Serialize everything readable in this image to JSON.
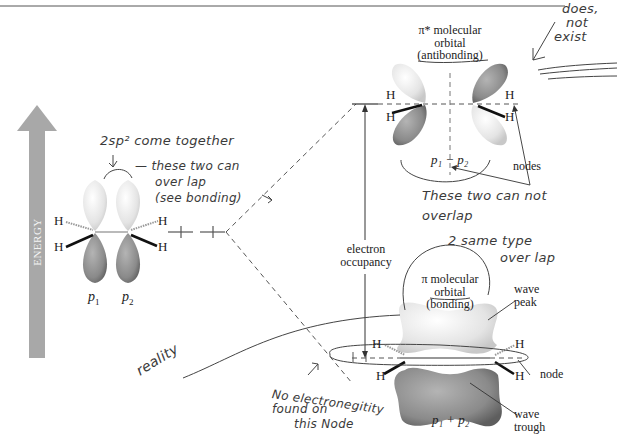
{
  "axis": {
    "energy_label": "ENERGY"
  },
  "atomic_orbitals": {
    "p1_label": "p",
    "p1_sub": "1",
    "p2_label": "p",
    "p2_sub": "2",
    "hydrogen": "H"
  },
  "antibonding": {
    "title_line1": "π* molecular",
    "title_line2": "orbital",
    "title_line3": "(antibonding)",
    "combo_label": "p₁ − p₂",
    "nodes_label": "nodes"
  },
  "bonding": {
    "title_line1": "π molecular",
    "title_line2": "orbital",
    "title_line3": "(bonding)",
    "combo_label": "p₁ + p₂",
    "wave_peak": [
      "wave",
      "peak"
    ],
    "wave_trough": [
      "wave",
      "trough"
    ],
    "node_label": "node"
  },
  "electron_occupancy": [
    "electron",
    "occupancy"
  ],
  "annotations": {
    "sp2": "2sp² come together",
    "overlap": [
      "— these two can",
      "over lap",
      "(see bonding)"
    ],
    "does_not_exist": [
      "does,",
      "not",
      "exist"
    ],
    "cannot_overlap": [
      "These two can not",
      "overlap"
    ],
    "same_type": [
      "2 same type",
      "over lap"
    ],
    "reality": "reality",
    "no_electronegativity": [
      "No electronegitity",
      "found on",
      "this Node"
    ]
  },
  "colors": {
    "lobe_light": "#e6e6e6",
    "lobe_dark": "#8a8a8a",
    "energy_arrow": "#a8a8a8",
    "ink": "#3a3a3a"
  }
}
